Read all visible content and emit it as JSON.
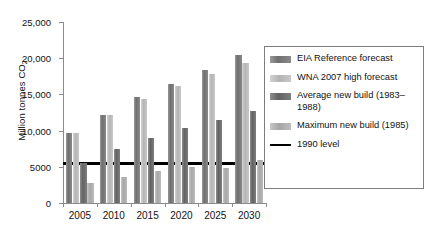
{
  "chart_data": {
    "type": "bar",
    "title": "",
    "xlabel": "",
    "ylabel": "Million tonnes CO2",
    "categories": [
      "2005",
      "2010",
      "2015",
      "2020",
      "2025",
      "2030"
    ],
    "ylim": [
      0,
      25000
    ],
    "ytick_values": [
      0,
      5000,
      10000,
      15000,
      20000,
      25000
    ],
    "ytick_labels": [
      "0",
      "5000",
      "10,000",
      "15,000",
      "20,000",
      "25,000"
    ],
    "grid": false,
    "legend_position": "right",
    "series": [
      {
        "name": "EIA Reference forecast",
        "color": "#767676",
        "values": [
          9700,
          12200,
          14600,
          16400,
          18400,
          20500
        ]
      },
      {
        "name": "WNA 2007 high forecast",
        "color": "#bcbcbc",
        "values": [
          9650,
          12200,
          14400,
          16100,
          17800,
          19400
        ]
      },
      {
        "name": "Average new build (1983-1988)",
        "color": "#6b6b6b",
        "values": [
          5500,
          7400,
          9000,
          10300,
          11500,
          12700
        ]
      },
      {
        "name": "Maximum new build (1985)",
        "color": "#afafaf",
        "values": [
          2700,
          3600,
          4400,
          5000,
          4900,
          5900
        ]
      }
    ],
    "reference_line": {
      "name": "1990 level",
      "value": 5400,
      "color": "#000000"
    },
    "annotations": []
  },
  "axis": {
    "y_title_main": "Million tonnes CO",
    "y_title_sub": "2"
  },
  "legend": {
    "items": [
      {
        "label": "EIA Reference forecast",
        "type": "swatch",
        "swatch_class": "bar-s0"
      },
      {
        "label": "WNA 2007 high forecast",
        "type": "swatch",
        "swatch_class": "bar-s1"
      },
      {
        "label": "Average new build (1983–1988)",
        "type": "swatch",
        "swatch_class": "bar-s2"
      },
      {
        "label": "Maximum new build (1985)",
        "type": "swatch",
        "swatch_class": "bar-s3"
      },
      {
        "label": "1990 level",
        "type": "line",
        "swatch_class": "line-swatch"
      }
    ]
  }
}
